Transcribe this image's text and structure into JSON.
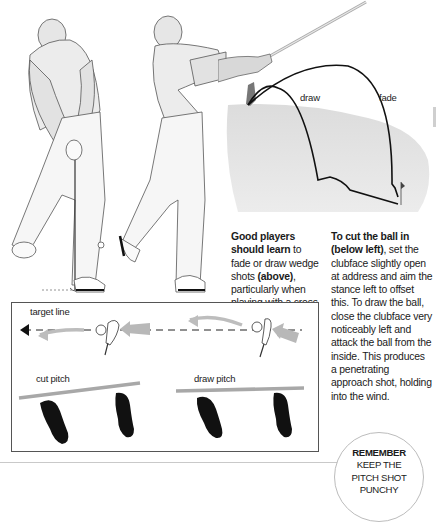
{
  "illustrations": {
    "golfer_address": "golfer-address-illustration",
    "golfer_followthrough": "golfer-follow-through-illustration",
    "trajectory": {
      "labels": {
        "draw": "draw",
        "fade": "fade"
      }
    }
  },
  "captions": {
    "left": {
      "bold_lead": "Good players should learn",
      "text": " to fade or draw wedge shots ",
      "bold_ref": "(above)",
      "text_end": ", particularly when playing with a cross wind."
    },
    "right": {
      "bold_lead": "To cut the ball in (below left)",
      "text": ", set the clubface slightly open at address and aim the stance left to offset this. To draw the ball, close the clubface very noticeably left and attack the ball from the inside. This produces a penetrating approach shot, holding into the wind."
    }
  },
  "diagram": {
    "target_line_label": "target line",
    "cut_pitch_label": "cut pitch",
    "draw_pitch_label": "draw pitch",
    "colors": {
      "arrow": "#b5b5b5",
      "stance_line": "#a8a8a8",
      "foot": "#111111"
    }
  },
  "remember": {
    "title": "REMEMBER",
    "line1": "KEEP THE",
    "line2": "PITCH SHOT",
    "line3": "PUNCHY"
  }
}
